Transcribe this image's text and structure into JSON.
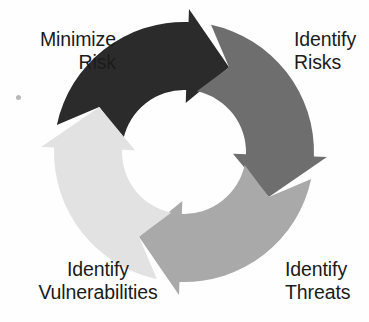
{
  "diagram": {
    "type": "circular-cycle-arrows",
    "background_color": "#fefefe",
    "text_color": "#1b1b1b",
    "center": {
      "x": 184,
      "y": 152
    },
    "outer_radius": 130,
    "inner_radius": 62,
    "segments": [
      {
        "id": "identify-risks",
        "label_line1": "Identify",
        "label_line2": "Risks",
        "color": "#2b2b2b",
        "position": "top-right",
        "start_angle_deg": -78,
        "end_angle_deg": 28,
        "order": 1
      },
      {
        "id": "identify-threats",
        "label_line1": "Identify",
        "label_line2": "Threats",
        "color": "#6e6e6e",
        "position": "bottom-right",
        "start_angle_deg": 12,
        "end_angle_deg": 118,
        "order": 2
      },
      {
        "id": "identify-vulnerabilities",
        "label_line1": "Identify",
        "label_line2": "Vulnerabilities",
        "color": "#a9a9a9",
        "position": "bottom-left",
        "start_angle_deg": 102,
        "end_angle_deg": 208,
        "order": 3
      },
      {
        "id": "minimize-risk",
        "label_line1": "Minimize",
        "label_line2": "Risk",
        "color": "#e2e2e2",
        "position": "top-left",
        "start_angle_deg": 192,
        "end_angle_deg": 298,
        "order": 4
      }
    ]
  },
  "artifact": {
    "speck_color": "#b8b8b8"
  }
}
